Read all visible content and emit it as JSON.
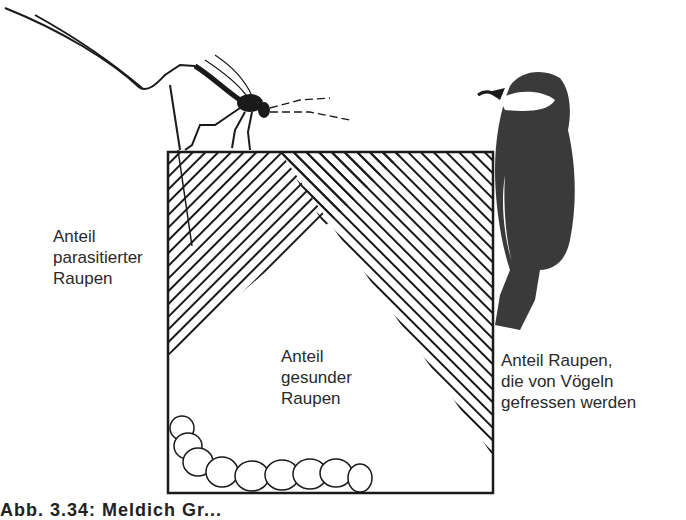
{
  "figure": {
    "type": "illustrated-proportion-diagram",
    "colors": {
      "ink": "#1a1a1a",
      "paper": "#ffffff"
    },
    "icons": {
      "parasitic_wasp": "wasp-icon",
      "bird": "titmouse-bird-icon",
      "caterpillar": "caterpillar-icon"
    },
    "regions": [
      {
        "id": "parasitized",
        "pattern": "diagonal-hatch-forward"
      },
      {
        "id": "eaten-by-birds",
        "pattern": "diagonal-hatch-backward"
      },
      {
        "id": "overlap",
        "pattern": "cross-hatch"
      },
      {
        "id": "healthy",
        "pattern": "blank"
      }
    ]
  },
  "labels": {
    "parasitized": [
      "Anteil",
      "parasitierter",
      "Raupen"
    ],
    "healthy": [
      "Anteil",
      "gesunder",
      "Raupen"
    ],
    "eaten": [
      "Anteil Raupen,",
      "die von Vögeln",
      "gefressen werden"
    ]
  },
  "caption": "Abb. 3.34: Meldich Gr..."
}
